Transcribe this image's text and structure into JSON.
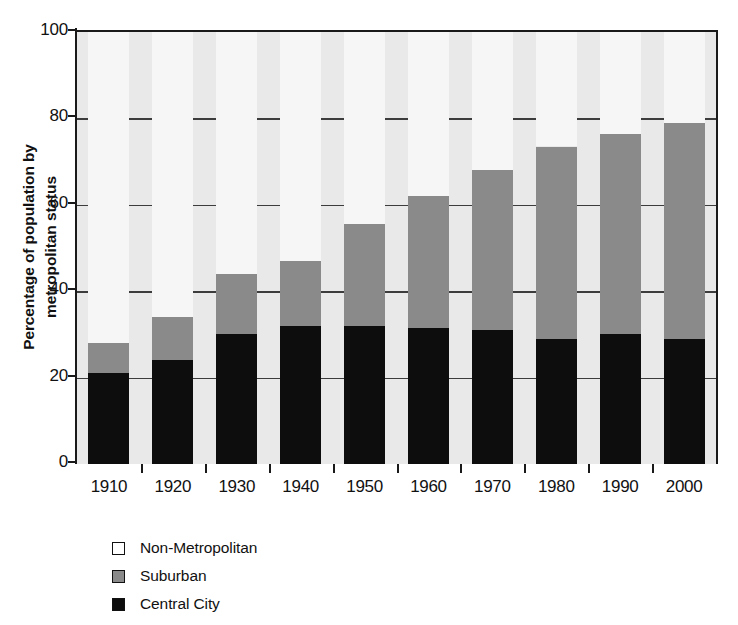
{
  "chart_data": {
    "type": "bar",
    "subtype": "stacked-bar-100",
    "title": "",
    "xlabel": "",
    "ylabel": "Percentage of population by metropolitan status",
    "ylabel_lines": [
      "Percentage of population by",
      "metropolitan status"
    ],
    "categories": [
      "1910",
      "1920",
      "1930",
      "1940",
      "1950",
      "1960",
      "1970",
      "1980",
      "1990",
      "2000"
    ],
    "ylim": [
      0,
      100
    ],
    "yticks": [
      0,
      20,
      40,
      60,
      80,
      100
    ],
    "ytick_labels": [
      "0",
      "20",
      "40",
      "60",
      "80",
      "100"
    ],
    "grid": "horizontal",
    "legend_position": "below-left",
    "series": [
      {
        "name": "Central City",
        "color": "#0d0d0d",
        "values": [
          21,
          24,
          30,
          32,
          32,
          31.5,
          31,
          29,
          30,
          29
        ]
      },
      {
        "name": "Suburban",
        "color": "#8a8a8a",
        "values": [
          7,
          10,
          14,
          15,
          23.5,
          30.5,
          37,
          44.5,
          46.5,
          50
        ]
      },
      {
        "name": "Non-Metropolitan",
        "color": "#f6f6f6",
        "values": [
          72,
          66,
          56,
          53,
          44.5,
          38,
          32,
          26.5,
          23.5,
          21
        ]
      }
    ],
    "cumulative_tops": {
      "central_city": [
        21,
        24,
        30,
        32,
        32,
        31.5,
        31,
        29,
        30,
        29
      ],
      "suburban": [
        28,
        34,
        44,
        47,
        55.5,
        62,
        68,
        73.5,
        76.5,
        79
      ],
      "non_metropolitan": [
        100,
        100,
        100,
        100,
        100,
        100,
        100,
        100,
        100,
        100
      ]
    }
  },
  "legend": {
    "items": [
      {
        "label": "Non-Metropolitan",
        "swatch": "legend-swatch-white"
      },
      {
        "label": "Suburban",
        "swatch": "legend-swatch-gray"
      },
      {
        "label": "Central City",
        "swatch": "legend-swatch-black"
      }
    ]
  },
  "colors": {
    "central_city": "#0d0d0d",
    "suburban": "#8a8a8a",
    "non_metropolitan": "#f6f6f6",
    "plot_background": "#e9e9e9",
    "axis": "#1a1a1a",
    "gridline": "#3c3c3c",
    "text": "#111111"
  }
}
